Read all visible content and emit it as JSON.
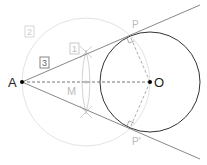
{
  "diagram": {
    "points": {
      "A": {
        "label": "A",
        "x": 22,
        "y": 82
      },
      "O": {
        "label": "O",
        "x": 150,
        "y": 82
      },
      "M": {
        "label": "M",
        "x": 86,
        "y": 82
      },
      "P": {
        "label": "P",
        "x": 136,
        "y": 34
      },
      "P_prime": {
        "label": "P'",
        "x": 136,
        "y": 130
      }
    },
    "steps": [
      {
        "label": "1",
        "x": 97,
        "y": 50
      },
      {
        "label": "2",
        "x": 29,
        "y": 33
      },
      {
        "label": "3",
        "x": 44,
        "y": 63
      }
    ],
    "circles": {
      "main": {
        "cx": 150,
        "cy": 82,
        "r": 50,
        "color": "#333333"
      },
      "construction": {
        "cx": 86,
        "cy": 82,
        "r": 64,
        "color": "#e3e3e3"
      }
    },
    "colors": {
      "tangent": "#888888",
      "dashed": "#777777",
      "labels_light": "#bbbbbb",
      "labels_dark": "#222222"
    }
  }
}
